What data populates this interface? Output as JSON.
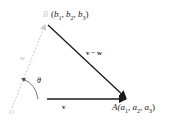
{
  "diagram": {
    "type": "vector-triangle",
    "points": {
      "origin": {
        "label": "O"
      },
      "B": {
        "label": "B",
        "coords_label": "(b",
        "coords": [
          "b",
          "1",
          ", b",
          "2",
          ", b",
          "3",
          ")"
        ]
      },
      "A": {
        "label": "A",
        "coords": [
          "(a",
          "1",
          ", a",
          "2",
          ", a",
          "3",
          ")"
        ]
      }
    },
    "vectors": {
      "v": {
        "label": "v",
        "from": "O",
        "to": "A"
      },
      "w": {
        "label": "w",
        "from": "O",
        "to": "B"
      },
      "v_minus_w": {
        "label": "v − w",
        "from": "B",
        "to": "A"
      }
    },
    "angle": {
      "label": "θ"
    },
    "colors": {
      "vector": "#1a1a1a",
      "faded": "#c8c8c8",
      "text": "#222222"
    }
  }
}
